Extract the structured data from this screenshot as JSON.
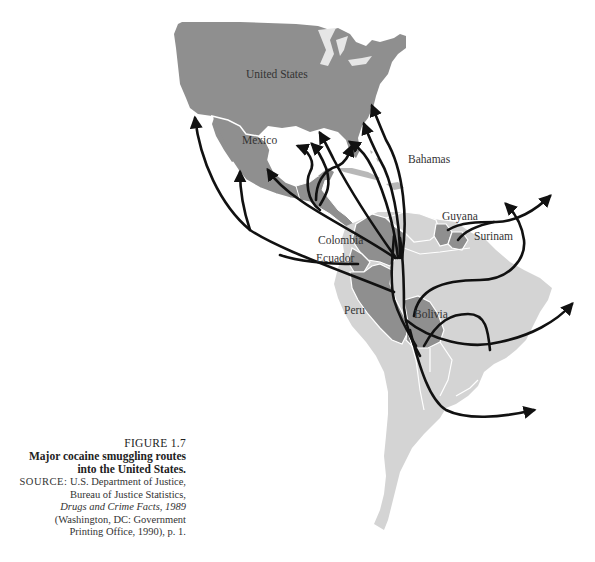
{
  "figure": {
    "number": "FIGURE 1.7",
    "title_line1": "Major cocaine smuggling routes",
    "title_line2": "into the United States.",
    "source_label": "SOURCE:",
    "source_line1": "U.S. Department of Justice,",
    "source_line2": "Bureau of Justice Statistics,",
    "source_line3": "Drugs and Crime Facts, 1989",
    "source_line4": "(Washington, DC: Government",
    "source_line5": "Printing Office, 1990), p. 1."
  },
  "map": {
    "labels": {
      "united_states": "United States",
      "mexico": "Mexico",
      "bahamas": "Bahamas",
      "colombia": "Colombia",
      "ecuador": "Ecuador",
      "guyana": "Guyana",
      "surinam": "Surinam",
      "peru": "Peru",
      "bolivia": "Bolivia"
    },
    "colors": {
      "highlight_country": "#8f8f8f",
      "other_land": "#d4d4d4",
      "border": "#ffffff",
      "route": "#111111",
      "background": "#ffffff"
    }
  }
}
